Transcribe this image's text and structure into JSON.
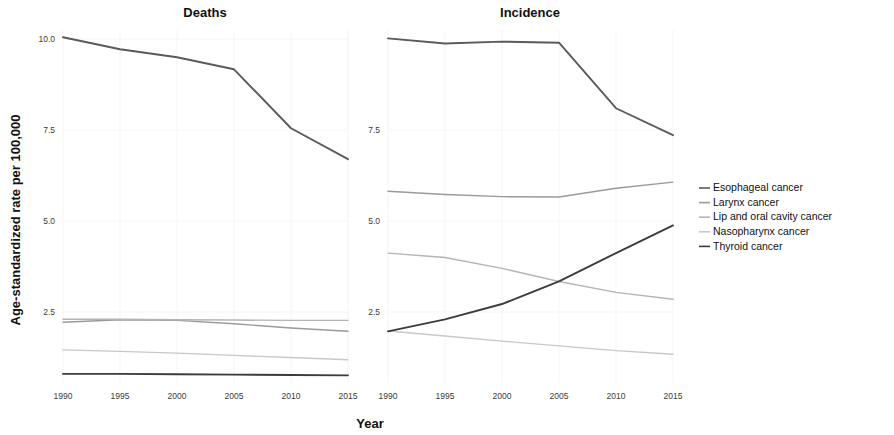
{
  "figure": {
    "y_axis_title": "Age-standardized rate per 100,000",
    "x_axis_title": "Year"
  },
  "legend": {
    "items": [
      {
        "label": "Esophageal cancer",
        "color": "#5a5a5a",
        "key": "esophageal"
      },
      {
        "label": "Larynx cancer",
        "color": "#9a9a9a",
        "key": "larynx"
      },
      {
        "label": "Lip and oral cavity cancer",
        "color": "#b4b4b4",
        "key": "lip_oral"
      },
      {
        "label": "Nasopharynx cancer",
        "color": "#c8c8c8",
        "key": "nasopharynx"
      },
      {
        "label": "Thyroid cancer",
        "color": "#3c3c3c",
        "key": "thyroid"
      }
    ]
  },
  "chart_data": [
    {
      "type": "line",
      "title": "Deaths",
      "xlabel": "Year",
      "ylabel": "Age-standardized rate per 100,000",
      "x": [
        1990,
        1995,
        2000,
        2005,
        2010,
        2015
      ],
      "xticks": [
        "1990",
        "1995",
        "2000",
        "2005",
        "2010",
        "2015"
      ],
      "yticks": [
        "10.0",
        "7.5",
        "5.0",
        "2.5"
      ],
      "ytickvals": [
        10.0,
        7.5,
        5.0,
        2.5
      ],
      "xlim": [
        1990,
        2015
      ],
      "ylim": [
        0.55,
        10.25
      ],
      "grid": true,
      "series": [
        {
          "name": "Esophageal cancer",
          "color": "#5a5a5a",
          "values": [
            10.05,
            9.72,
            9.5,
            9.17,
            7.55,
            6.7
          ]
        },
        {
          "name": "Larynx cancer",
          "color": "#9a9a9a",
          "values": [
            2.22,
            2.29,
            2.27,
            2.18,
            2.06,
            1.97
          ]
        },
        {
          "name": "Lip and oral cavity cancer",
          "color": "#b4b4b4",
          "values": [
            2.3,
            2.3,
            2.29,
            2.28,
            2.27,
            2.27
          ]
        },
        {
          "name": "Nasopharynx cancer",
          "color": "#c8c8c8",
          "values": [
            1.46,
            1.42,
            1.37,
            1.31,
            1.25,
            1.19
          ]
        },
        {
          "name": "Thyroid cancer",
          "color": "#3c3c3c",
          "values": [
            0.8,
            0.8,
            0.79,
            0.78,
            0.77,
            0.76
          ]
        }
      ]
    },
    {
      "type": "line",
      "title": "Incidence",
      "xlabel": "Year",
      "ylabel": "Age-standardized rate per 100,000",
      "x": [
        1990,
        1995,
        2000,
        2005,
        2010,
        2015
      ],
      "xticks": [
        "1990",
        "1995",
        "2000",
        "2005",
        "2010",
        "2015"
      ],
      "yticks": [
        "7.5",
        "5.0",
        "2.5"
      ],
      "ytickvals": [
        7.5,
        5.0,
        2.5
      ],
      "xlim": [
        1990,
        2015
      ],
      "ylim": [
        0.55,
        10.25
      ],
      "grid": true,
      "series": [
        {
          "name": "Esophageal cancer",
          "color": "#5a5a5a",
          "values": [
            10.02,
            9.88,
            9.93,
            9.9,
            8.1,
            7.36
          ]
        },
        {
          "name": "Larynx cancer",
          "color": "#9a9a9a",
          "values": [
            5.82,
            5.73,
            5.67,
            5.66,
            5.9,
            6.07
          ]
        },
        {
          "name": "Lip and oral cavity cancer",
          "color": "#b4b4b4",
          "values": [
            4.12,
            4.0,
            3.7,
            3.34,
            3.04,
            2.85
          ]
        },
        {
          "name": "Nasopharynx cancer",
          "color": "#c8c8c8",
          "values": [
            1.98,
            1.84,
            1.7,
            1.57,
            1.44,
            1.34
          ]
        },
        {
          "name": "Thyroid cancer",
          "color": "#3c3c3c",
          "values": [
            1.97,
            2.3,
            2.72,
            3.34,
            4.12,
            4.88
          ]
        }
      ]
    }
  ]
}
